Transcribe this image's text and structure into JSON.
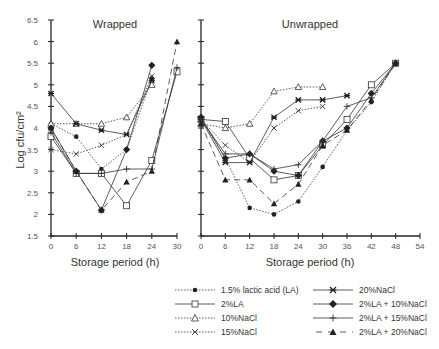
{
  "chart_data": [
    {
      "type": "line",
      "title": "Wrapped",
      "xlabel": "Storage period (h)",
      "ylabel": "Log cfu/cm²",
      "x_ticks": [
        0,
        6,
        12,
        18,
        24,
        30
      ],
      "y_ticks": [
        1.5,
        2,
        2.5,
        3,
        3.5,
        4,
        4.5,
        5,
        5.5,
        6,
        6.5
      ],
      "xlim": [
        0,
        30
      ],
      "ylim": [
        1.5,
        6.5
      ],
      "grid": false,
      "series": [
        {
          "name": "1.5% lactic acid (LA)",
          "x": [
            0,
            6,
            12,
            18,
            24
          ],
          "values": [
            4.1,
            3.8,
            3.05,
            3.5,
            5.15
          ]
        },
        {
          "name": "2%LA",
          "x": [
            0,
            6,
            12,
            18,
            24,
            30
          ],
          "values": [
            3.8,
            2.95,
            2.95,
            2.2,
            3.25,
            5.3
          ]
        },
        {
          "name": "10%NaCl",
          "x": [
            0,
            6,
            12,
            18,
            24
          ],
          "values": [
            4.1,
            4.1,
            4.1,
            4.25,
            5.0
          ]
        },
        {
          "name": "15%NaCl",
          "x": [
            0,
            6,
            12,
            18,
            24
          ],
          "values": [
            3.5,
            3.4,
            3.6,
            3.85,
            5.2
          ]
        },
        {
          "name": "20%NaCl",
          "x": [
            0,
            6,
            12,
            18,
            24
          ],
          "values": [
            4.8,
            4.1,
            3.95,
            3.85,
            5.1
          ]
        },
        {
          "name": "2%LA + 10%NaCl",
          "x": [
            0,
            6,
            12,
            18,
            24
          ],
          "values": [
            4.0,
            3.0,
            2.1,
            3.5,
            5.45
          ]
        },
        {
          "name": "2%LA + 15%NaCl",
          "x": [
            0,
            6,
            12,
            18,
            24,
            30
          ],
          "values": [
            3.9,
            2.95,
            2.95,
            3.05,
            3.05,
            5.4
          ]
        },
        {
          "name": "2%LA + 20%NaCl",
          "x": [
            0,
            6,
            12,
            18,
            24,
            30
          ],
          "values": [
            4.0,
            3.0,
            2.1,
            2.75,
            3.0,
            6.0
          ]
        }
      ]
    },
    {
      "type": "line",
      "title": "Unwrapped",
      "xlabel": "Storage period (h)",
      "ylabel": "Log cfu/cm²",
      "x_ticks": [
        0,
        6,
        12,
        18,
        24,
        30,
        36,
        42,
        48,
        54
      ],
      "y_ticks": [
        1.5,
        2,
        2.5,
        3,
        3.5,
        4,
        4.5,
        5,
        5.5,
        6,
        6.5
      ],
      "xlim": [
        0,
        54
      ],
      "ylim": [
        1.5,
        6.5
      ],
      "grid": false,
      "series": [
        {
          "name": "1.5% lactic acid (LA)",
          "x": [
            0,
            6,
            12,
            18,
            24,
            30,
            36,
            42,
            48
          ],
          "values": [
            4.2,
            3.3,
            2.15,
            2.0,
            2.3,
            3.1,
            3.95,
            4.6,
            5.5
          ]
        },
        {
          "name": "2%LA",
          "x": [
            0,
            6,
            12,
            18,
            24,
            30,
            36,
            42,
            48
          ],
          "values": [
            4.2,
            4.15,
            3.3,
            2.8,
            2.9,
            3.6,
            4.2,
            5.0,
            5.5
          ]
        },
        {
          "name": "10%NaCl",
          "x": [
            0,
            6,
            12,
            18,
            24,
            30
          ],
          "values": [
            4.1,
            4.0,
            4.1,
            4.85,
            4.95,
            4.95
          ]
        },
        {
          "name": "15%NaCl",
          "x": [
            0,
            6,
            12,
            18,
            24,
            30
          ],
          "values": [
            4.2,
            3.6,
            3.2,
            4.0,
            4.4,
            4.5
          ]
        },
        {
          "name": "20%NaCl",
          "x": [
            0,
            6,
            12,
            18,
            24,
            30,
            36
          ],
          "values": [
            4.2,
            3.2,
            3.2,
            4.25,
            4.65,
            4.65,
            4.75
          ]
        },
        {
          "name": "2%LA + 10%NaCl",
          "x": [
            0,
            6,
            12,
            18,
            24,
            30,
            36,
            42,
            48
          ],
          "values": [
            4.25,
            3.3,
            3.4,
            3.0,
            2.9,
            3.7,
            4.0,
            4.8,
            5.5
          ]
        },
        {
          "name": "2%LA + 15%NaCl",
          "x": [
            0,
            6,
            12,
            18,
            24,
            30,
            36,
            42,
            48
          ],
          "values": [
            4.2,
            3.4,
            3.4,
            3.05,
            3.15,
            3.7,
            4.5,
            4.7,
            5.5
          ]
        },
        {
          "name": "2%LA + 20%NaCl",
          "x": [
            0,
            6,
            12,
            18,
            24,
            30,
            36,
            42,
            48
          ],
          "values": [
            4.1,
            2.8,
            2.8,
            2.25,
            2.7,
            3.6,
            3.95,
            4.65,
            5.5
          ]
        }
      ]
    }
  ],
  "legend": {
    "items": [
      {
        "label": "1.5% lactic acid (LA)",
        "marker": "filled-circle",
        "line": "dotted"
      },
      {
        "label": "2%LA",
        "marker": "open-square",
        "line": "solid"
      },
      {
        "label": "10%NaCl",
        "marker": "open-triangle",
        "line": "dotted"
      },
      {
        "label": "15%NaCl",
        "marker": "x",
        "line": "dotted"
      },
      {
        "label": "20%NaCl",
        "marker": "star",
        "line": "solid"
      },
      {
        "label": "2%LA + 10%NaCl",
        "marker": "filled-diamond",
        "line": "solid"
      },
      {
        "label": "2%LA + 15%NaCl",
        "marker": "plus",
        "line": "solid"
      },
      {
        "label": "2%LA + 20%NaCl",
        "marker": "filled-triangle",
        "line": "dashed"
      }
    ]
  },
  "colors": {
    "line": "#333333",
    "axis": "#222222",
    "text": "#333333"
  }
}
